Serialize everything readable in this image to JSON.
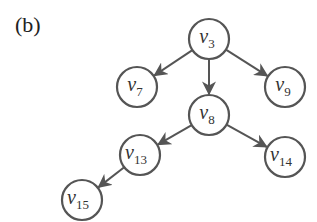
{
  "panel_label": "(b)",
  "nodes": [
    {
      "id": "v3",
      "base": "v",
      "sub": "3",
      "x": 209,
      "y": 39
    },
    {
      "id": "v7",
      "base": "v",
      "sub": "7",
      "x": 137,
      "y": 87
    },
    {
      "id": "v9",
      "base": "v",
      "sub": "9",
      "x": 285,
      "y": 87
    },
    {
      "id": "v8",
      "base": "v",
      "sub": "8",
      "x": 209,
      "y": 115
    },
    {
      "id": "v13",
      "base": "v",
      "sub": "13",
      "x": 140,
      "y": 155
    },
    {
      "id": "v14",
      "base": "v",
      "sub": "14",
      "x": 285,
      "y": 157
    },
    {
      "id": "v15",
      "base": "v",
      "sub": "15",
      "x": 82,
      "y": 200
    }
  ],
  "edges": [
    {
      "from": "v3",
      "to": "v7"
    },
    {
      "from": "v3",
      "to": "v8"
    },
    {
      "from": "v3",
      "to": "v9"
    },
    {
      "from": "v8",
      "to": "v13"
    },
    {
      "from": "v8",
      "to": "v14"
    },
    {
      "from": "v13",
      "to": "v15"
    }
  ],
  "style": {
    "node_radius": 20,
    "stroke": "#555555"
  }
}
